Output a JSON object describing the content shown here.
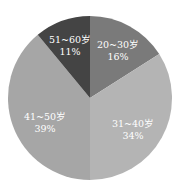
{
  "chart_data": {
    "type": "pie",
    "title": "",
    "categories": [
      "20~30岁",
      "31~40岁",
      "41~50岁",
      "51~60岁"
    ],
    "values": [
      16,
      34,
      39,
      11
    ],
    "unit": "%",
    "colors": [
      "#7a7a7a",
      "#b4b4b4",
      "#a6a6a6",
      "#444444"
    ],
    "start_angle_deg": 0,
    "direction": "clockwise",
    "legend": "none",
    "labels": [
      {
        "name": "20~30岁",
        "pct": "16%"
      },
      {
        "name": "31~40岁",
        "pct": "34%"
      },
      {
        "name": "41~50岁",
        "pct": "39%"
      },
      {
        "name": "51~60岁",
        "pct": "11%"
      }
    ]
  }
}
